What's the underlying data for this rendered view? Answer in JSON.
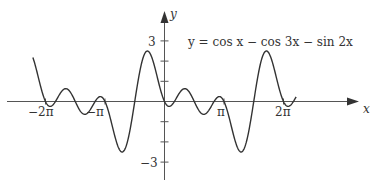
{
  "chart_data": {
    "type": "line",
    "title": "",
    "equation": "y = cos x − cos 3x − sin 2x",
    "xlabel": "x",
    "ylabel": "y",
    "xlim": [
      -7.3,
      7.3
    ],
    "ylim": [
      -3.2,
      3.6
    ],
    "x_ticks": [
      {
        "value": -6.2832,
        "label": "−2π"
      },
      {
        "value": -3.1416,
        "label": "−π"
      },
      {
        "value": 3.1416,
        "label": "π"
      },
      {
        "value": 6.2832,
        "label": "2π"
      }
    ],
    "y_ticks": [
      {
        "value": 3,
        "label": "3"
      },
      {
        "value": 2,
        "label": ""
      },
      {
        "value": 1,
        "label": ""
      },
      {
        "value": -1,
        "label": ""
      },
      {
        "value": -2,
        "label": ""
      },
      {
        "value": -3,
        "label": "−3"
      }
    ],
    "grid": false,
    "series": [
      {
        "name": "y = cos x − cos 3x − sin 2x",
        "domain": [
          -6.95,
          6.95
        ],
        "color": "#333333"
      }
    ]
  },
  "labels": {
    "x_axis": "x",
    "y_axis": "y",
    "y_top": "3",
    "y_bottom": "−3",
    "x_neg2pi": "−2π",
    "x_negpi": "−π",
    "x_pi": "π",
    "x_2pi": "2π",
    "equation": "y = cos x − cos 3x − sin 2x"
  }
}
